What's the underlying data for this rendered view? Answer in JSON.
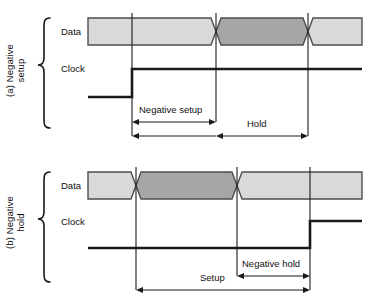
{
  "figure": {
    "width": 376,
    "height": 299,
    "background": "#ffffff"
  },
  "colors": {
    "line": "#1a1a1a",
    "data_band_light": "#d9d9d9",
    "data_band_dark": "#a6a6a6",
    "band_outline": "#4d4d4d",
    "text": "#111111"
  },
  "panels": [
    {
      "id": "a",
      "caption": "(a) Negative\nsetup",
      "caption_line1": "(a) Negative",
      "caption_line2": "setup",
      "signals": [
        {
          "name": "data",
          "label": "Data"
        },
        {
          "name": "clock",
          "label": "Clock"
        }
      ],
      "clock_edge": "rising",
      "measurements": [
        {
          "name": "negative-setup",
          "label": "Negative setup",
          "from_x": 132,
          "to_x": 216
        },
        {
          "name": "hold",
          "label": "Hold",
          "from_x": 216,
          "to_x": 308
        }
      ],
      "edges_x": [
        132,
        216,
        308
      ],
      "data_transitions_x": [
        216,
        308
      ],
      "clock_transition_x": 132
    },
    {
      "id": "b",
      "caption": "(b) Negative\nhold",
      "caption_line1": "(b) Negative",
      "caption_line2": "hold",
      "signals": [
        {
          "name": "data",
          "label": "Data"
        },
        {
          "name": "clock",
          "label": "Clock"
        }
      ],
      "clock_edge": "rising",
      "measurements": [
        {
          "name": "setup",
          "label": "Setup",
          "from_x": 136,
          "to_x": 310
        },
        {
          "name": "negative-hold",
          "label": "Negative hold",
          "from_x": 237,
          "to_x": 310
        }
      ],
      "edges_x": [
        136,
        237,
        310
      ],
      "data_transitions_x": [
        136,
        237
      ],
      "clock_transition_x": 310
    }
  ]
}
